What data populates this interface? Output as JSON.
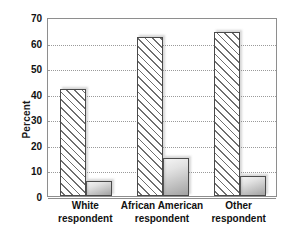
{
  "chart_data": {
    "type": "bar",
    "title": "",
    "subtitle": "",
    "xlabel": "",
    "ylabel": "Percent",
    "ylim": [
      0,
      70
    ],
    "yticks": [
      0,
      10,
      20,
      30,
      40,
      50,
      60,
      70
    ],
    "ytick_labels": [
      "0",
      "10",
      "20",
      "30",
      "40",
      "50",
      "60",
      "70"
    ],
    "grid": true,
    "grid_axis": "y",
    "legend": false,
    "legend_position": "none",
    "categories": [
      "White\nrespondent",
      "African American\nrespondent",
      "Other\nrespondent"
    ],
    "category_lines": [
      [
        "White",
        "respondent"
      ],
      [
        "African American",
        "respondent"
      ],
      [
        "Other",
        "respondent"
      ]
    ],
    "series": [
      {
        "name": "series-1",
        "style": "diagonal-hatch",
        "values": [
          42,
          62,
          64
        ]
      },
      {
        "name": "series-2",
        "style": "gray-gradient",
        "values": [
          6,
          15,
          8
        ]
      }
    ]
  },
  "colors": {
    "axis": "#8e8e8e",
    "gridline": "#9a9a9a",
    "bar_outline": "#4a4a4a",
    "hatch_line": "#6f6f6f",
    "gradient_light": "#f4f4f4",
    "gradient_dark": "#a2a2a2",
    "text": "#111111",
    "background": "#ffffff"
  }
}
